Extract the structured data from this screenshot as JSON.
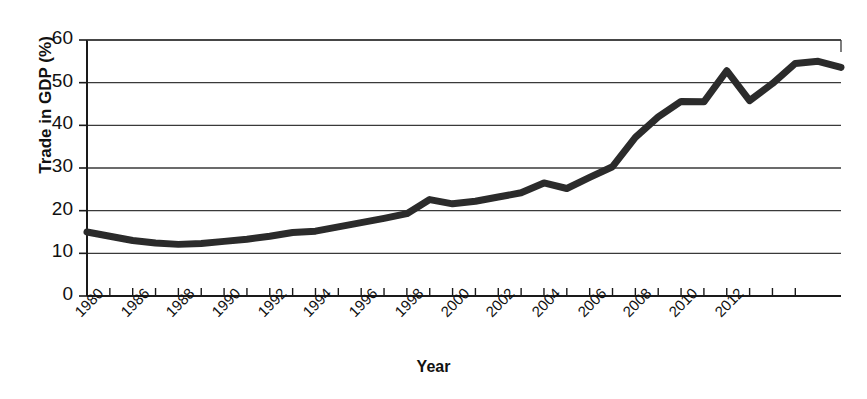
{
  "chart_data": {
    "type": "line",
    "title": "",
    "xlabel": "Year",
    "ylabel": "Trade in GDP (%)",
    "xlim": [
      1980,
      2013
    ],
    "ylim": [
      0,
      60
    ],
    "grid": true,
    "legend": "none",
    "y_ticks": [
      0,
      10,
      20,
      30,
      40,
      50,
      60
    ],
    "x_tick_labels": [
      "1980",
      "",
      "1986",
      "",
      "1988",
      "",
      "1990",
      "",
      "1992",
      "",
      "1994",
      "",
      "1996",
      "",
      "1998",
      "",
      "2000",
      "",
      "2002",
      "",
      "2004",
      "",
      "2006",
      "",
      "2008",
      "",
      "2010",
      "",
      "2012",
      "",
      "",
      ""
    ],
    "series": [
      {
        "name": "Trade in GDP",
        "color": "#2b2b2b",
        "line_width": 7,
        "x": [
          1980,
          1981,
          1982,
          1983,
          1984,
          1985,
          1986,
          1987,
          1988,
          1989,
          1990,
          1991,
          1992,
          1993,
          1994,
          1995,
          1996,
          1997,
          1998,
          1999,
          2000,
          2001,
          2002,
          2003,
          2004,
          2005,
          2006,
          2007,
          2008,
          2009,
          2010,
          2011,
          2012,
          2013
        ],
        "values": [
          15.0,
          14.0,
          13.0,
          12.4,
          12.1,
          12.3,
          12.8,
          13.3,
          14.0,
          14.9,
          15.2,
          16.2,
          17.2,
          18.2,
          19.3,
          22.6,
          21.6,
          22.2,
          23.2,
          24.2,
          26.5,
          25.2,
          27.8,
          30.3,
          37.2,
          42.0,
          45.6,
          45.5,
          52.8,
          45.8,
          49.8,
          54.5,
          55.0,
          53.6
        ]
      }
    ]
  },
  "axis": {
    "y_label": "Trade in GDP (%)",
    "x_label": "Year"
  }
}
